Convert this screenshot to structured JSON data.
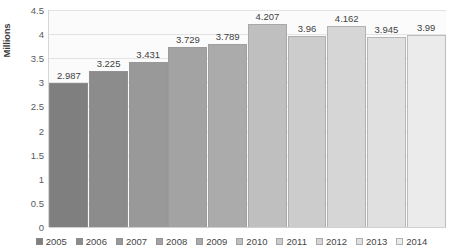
{
  "chart_data": {
    "type": "bar",
    "title": "",
    "xlabel": "",
    "ylabel": "Millions",
    "categories": [
      "2005",
      "2006",
      "2007",
      "2008",
      "2009",
      "2010",
      "2011",
      "2012",
      "2013",
      "2014"
    ],
    "values": [
      2.987,
      3.225,
      3.431,
      3.729,
      3.789,
      4.207,
      3.96,
      4.162,
      3.945,
      3.99
    ],
    "value_labels": [
      "2.987",
      "3.225",
      "3.431",
      "3.729",
      "3.789",
      "4.207",
      "3.96",
      "4.162",
      "3.945",
      "3.99"
    ],
    "ylim": [
      0,
      4.5
    ],
    "ytick_labels": [
      "0",
      "0.5",
      "1",
      "1.5",
      "2",
      "2.5",
      "3",
      "3.5",
      "4",
      "4.5"
    ],
    "ytick_values": [
      0,
      0.5,
      1,
      1.5,
      2,
      2.5,
      3,
      3.5,
      4,
      4.5
    ],
    "grid": true,
    "legend_position": "bottom",
    "series_colors": [
      "#7f7f7f",
      "#8c8c8c",
      "#999999",
      "#a3a3a3",
      "#ababab",
      "#bfbfbf",
      "#cccccc",
      "#d6d6d6",
      "#e0e0e0",
      "#ebebeb"
    ],
    "plot_background": "#fbfbfb",
    "gridline_color": "#e3e3e3",
    "label_text_color": "#3f3f3f"
  },
  "legend": {
    "items": [
      {
        "label": "2005"
      },
      {
        "label": "2006"
      },
      {
        "label": "2007"
      },
      {
        "label": "2008"
      },
      {
        "label": "2009"
      },
      {
        "label": "2010"
      },
      {
        "label": "2011"
      },
      {
        "label": "2012"
      },
      {
        "label": "2013"
      },
      {
        "label": "2014"
      }
    ]
  }
}
